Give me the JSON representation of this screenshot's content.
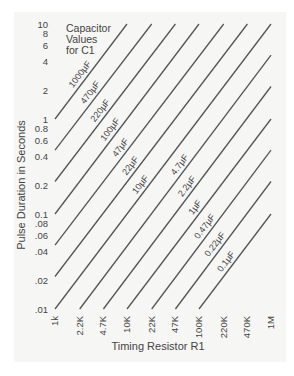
{
  "chart_data": {
    "type": "line",
    "title_lines": [
      "Capacitor",
      "Values",
      "for C1"
    ],
    "xlabel": "Timing Resistor R1",
    "ylabel": "Pulse Duration in Seconds",
    "x_scale": "log",
    "y_scale": "log",
    "xlim": [
      1000,
      1000000
    ],
    "ylim": [
      0.01,
      10
    ],
    "grid": false,
    "x_ticks": [
      "1k",
      "2.2K",
      "4.7K",
      "10K",
      "22K",
      "47K",
      "100K",
      "220K",
      "470K",
      "1M"
    ],
    "x_tick_values": [
      1000,
      2200,
      4700,
      10000,
      22000,
      47000,
      100000,
      220000,
      470000,
      1000000
    ],
    "y_ticks": [
      "10",
      "8",
      "6",
      "4",
      "2",
      "1",
      "0.8",
      "0.6",
      "0.4",
      "0.2",
      "0.1",
      ".08",
      ".06",
      ".04",
      ".02",
      ".01"
    ],
    "y_tick_values": [
      10,
      8,
      6,
      4,
      2,
      1,
      0.8,
      0.6,
      0.4,
      0.2,
      0.1,
      0.08,
      0.06,
      0.04,
      0.02,
      0.01
    ],
    "series": [
      {
        "name": "1000µF",
        "label": "1000µF",
        "points": [
          [
            1000,
            1
          ],
          [
            10000,
            10
          ]
        ]
      },
      {
        "name": "470µF",
        "label": "470µF",
        "points": [
          [
            1000,
            0.47
          ],
          [
            22000,
            10
          ]
        ]
      },
      {
        "name": "220µF",
        "label": "220µF",
        "points": [
          [
            1000,
            0.22
          ],
          [
            47000,
            10
          ]
        ]
      },
      {
        "name": "100µF",
        "label": "100µF",
        "points": [
          [
            1000,
            0.1
          ],
          [
            100000,
            10
          ]
        ]
      },
      {
        "name": "47µF",
        "label": "47µF",
        "points": [
          [
            1000,
            0.047
          ],
          [
            220000,
            10
          ]
        ]
      },
      {
        "name": "22µF",
        "label": "22µF",
        "points": [
          [
            1000,
            0.022
          ],
          [
            470000,
            10
          ]
        ]
      },
      {
        "name": "10µF",
        "label": "10µF",
        "points": [
          [
            1000,
            0.01
          ],
          [
            1000000,
            10
          ]
        ]
      },
      {
        "name": "4.7µF",
        "label": "4.7µF",
        "points": [
          [
            2200,
            0.01
          ],
          [
            1000000,
            4.7
          ]
        ]
      },
      {
        "name": "2.2µF",
        "label": "2.2µF",
        "points": [
          [
            4700,
            0.01
          ],
          [
            1000000,
            2.2
          ]
        ]
      },
      {
        "name": "1µF",
        "label": "1µF",
        "points": [
          [
            10000,
            0.01
          ],
          [
            1000000,
            1
          ]
        ]
      },
      {
        "name": "0.47µF",
        "label": "0.47µF",
        "points": [
          [
            22000,
            0.01
          ],
          [
            1000000,
            0.47
          ]
        ]
      },
      {
        "name": "0.22µF",
        "label": "0.22µF",
        "points": [
          [
            47000,
            0.01
          ],
          [
            1000000,
            0.22
          ]
        ]
      },
      {
        "name": "0.1µF",
        "label": "0.1µF",
        "points": [
          [
            100000,
            0.01
          ],
          [
            1000000,
            0.1
          ]
        ]
      }
    ],
    "line_color": "#555555"
  }
}
